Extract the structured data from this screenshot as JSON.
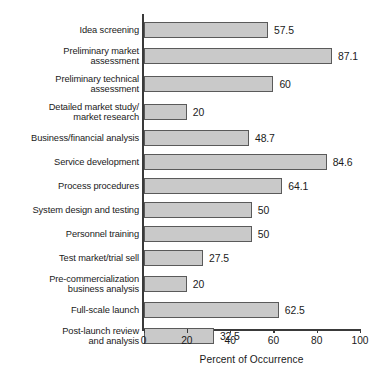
{
  "chart_data": {
    "type": "bar",
    "orientation": "horizontal",
    "title": "",
    "xlabel": "Percent of Occurrence",
    "ylabel": "",
    "xlim": [
      0,
      100
    ],
    "xticks": [
      0,
      20,
      40,
      60,
      80,
      100
    ],
    "xtick_labels": [
      "0",
      "20",
      "40",
      "60",
      "80",
      "100"
    ],
    "grid": false,
    "legend": false,
    "bar_fill_color": "#c9c9c9",
    "bar_border_color": "#5a5a5a",
    "background_color": "#ffffff",
    "categories": [
      "Idea screening",
      "Preliminary market assessment",
      "Preliminary technical assessment",
      "Detailed market study/ market research",
      "Business/financial analysis",
      "Service development",
      "Process procedures",
      "System design and testing",
      "Personnel training",
      "Test market/trial sell",
      "Pre-commercialization business analysis",
      "Full-scale launch",
      "Post-launch review and analysis"
    ],
    "values": [
      57.5,
      87.1,
      60,
      20,
      48.7,
      84.6,
      64.1,
      50,
      50,
      27.5,
      20,
      62.5,
      32.5
    ],
    "value_labels": [
      "57.5",
      "87.1",
      "60",
      "20",
      "48.7",
      "84.6",
      "64.1",
      "50",
      "50",
      "27.5",
      "20",
      "62.5",
      "32.5"
    ]
  },
  "rows": [
    {
      "label": "Idea screening",
      "value": 57.5,
      "value_label": "57.5",
      "lines": 1
    },
    {
      "label": "Preliminary market\nassessment",
      "value": 87.1,
      "value_label": "87.1",
      "lines": 2
    },
    {
      "label": "Preliminary technical\nassessment",
      "value": 60,
      "value_label": "60",
      "lines": 2
    },
    {
      "label": "Detailed market study/\nmarket research",
      "value": 20,
      "value_label": "20",
      "lines": 2
    },
    {
      "label": "Business/financial analysis",
      "value": 48.7,
      "value_label": "48.7",
      "lines": 1
    },
    {
      "label": "Service development",
      "value": 84.6,
      "value_label": "84.6",
      "lines": 1
    },
    {
      "label": "Process procedures",
      "value": 64.1,
      "value_label": "64.1",
      "lines": 1
    },
    {
      "label": "System design and testing",
      "value": 50,
      "value_label": "50",
      "lines": 1
    },
    {
      "label": "Personnel training",
      "value": 50,
      "value_label": "50",
      "lines": 1
    },
    {
      "label": "Test market/trial sell",
      "value": 27.5,
      "value_label": "27.5",
      "lines": 1
    },
    {
      "label": "Pre-commercialization\nbusiness analysis",
      "value": 20,
      "value_label": "20",
      "lines": 2
    },
    {
      "label": "Full-scale launch",
      "value": 62.5,
      "value_label": "62.5",
      "lines": 1
    },
    {
      "label": "Post-launch review\nand analysis",
      "value": 32.5,
      "value_label": "32.5",
      "lines": 2
    }
  ],
  "axis": {
    "ticks": [
      "0",
      "20",
      "40",
      "60",
      "80",
      "100"
    ],
    "title": "Percent of Occurrence"
  }
}
